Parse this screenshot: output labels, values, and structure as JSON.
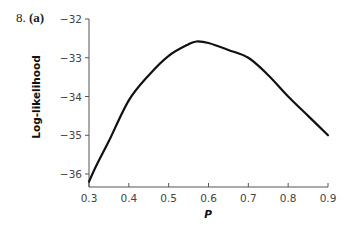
{
  "figure": {
    "number": "8.",
    "panel": "(a)"
  },
  "chart_data": {
    "type": "line",
    "title": "",
    "xlabel": "P",
    "ylabel": "Log-likelihood",
    "xlim": [
      0.3,
      0.9
    ],
    "ylim": [
      -36.2,
      -32
    ],
    "x_ticks": [
      "0.3",
      "0.4",
      "0.5",
      "0.6",
      "0.7",
      "0.8",
      "0.9"
    ],
    "y_ticks": [
      "-32",
      "-33",
      "-34",
      "-35",
      "-36"
    ],
    "grid": false,
    "legend": null,
    "series": [
      {
        "name": "Log-likelihood",
        "color": "#111111",
        "x": [
          0.3,
          0.32,
          0.35,
          0.4,
          0.45,
          0.5,
          0.55,
          0.57,
          0.6,
          0.65,
          0.7,
          0.75,
          0.8,
          0.85,
          0.9
        ],
        "y": [
          -36.2,
          -35.75,
          -35.15,
          -34.1,
          -33.45,
          -32.95,
          -32.65,
          -32.58,
          -32.62,
          -32.8,
          -33.0,
          -33.45,
          -34.0,
          -34.5,
          -35.0
        ]
      }
    ]
  }
}
